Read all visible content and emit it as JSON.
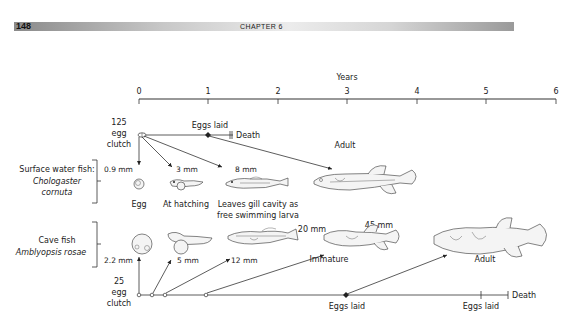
{
  "header": {
    "page_number": "148",
    "chapter": "CHAPTER 6"
  },
  "axis": {
    "title": "Years",
    "ticks": [
      "0",
      "1",
      "2",
      "3",
      "4",
      "5",
      "6"
    ]
  },
  "surface_fish": {
    "label_line1": "Surface water fish:",
    "species_line1": "Chologaster",
    "species_line2": "cornuta",
    "clutch_count": "125",
    "clutch_word1": "egg",
    "clutch_word2": "clutch",
    "eggs_laid": "Eggs laid",
    "death": "Death",
    "stages": [
      {
        "size": "0.9 mm",
        "name": "Egg"
      },
      {
        "size": "3 mm",
        "name": "At hatching"
      },
      {
        "size": "8 mm",
        "name_line1": "Leaves gill cavity as",
        "name_line2": "free swimming larva"
      },
      {
        "size": "",
        "name": "Adult"
      }
    ]
  },
  "cave_fish": {
    "label_line1": "Cave fish",
    "species": "Amblyopsis rosae",
    "clutch_count": "25",
    "clutch_word1": "egg",
    "clutch_word2": "clutch",
    "eggs_laid_1": "Eggs laid",
    "eggs_laid_2": "Eggs laid",
    "death": "Death",
    "stages": [
      {
        "size": "2.2 mm",
        "name": ""
      },
      {
        "size": "5 mm",
        "name": ""
      },
      {
        "size": "12 mm",
        "name": ""
      },
      {
        "size": "20 mm",
        "name": "Immature"
      },
      {
        "size": "45 mm",
        "name": "Adult"
      }
    ]
  }
}
